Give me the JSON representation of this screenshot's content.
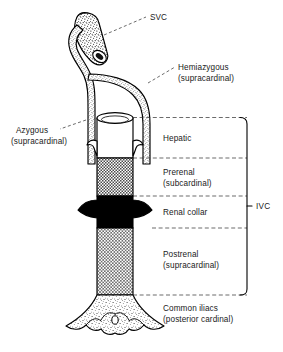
{
  "figure": {
    "labels": {
      "svc": "SVC",
      "hemiazygous_line1": "Hemiazygous",
      "hemiazygous_line2": "(supracardinal)",
      "azygous_line1": "Azygous",
      "azygous_line2": "(supracardinal)",
      "hepatic": "Hepatic",
      "prerenal_line1": "Prerenal",
      "prerenal_line2": "(subcardinal)",
      "renal_collar": "Renal collar",
      "postrenal_line1": "Postrenal",
      "postrenal_line2": "(supracardinal)",
      "common_iliacs_line1": "Common iliacs",
      "common_iliacs_line2": "(posterior cardinal)",
      "ivc": "IVC"
    },
    "segments": [
      {
        "name": "hepatic",
        "label": "Hepatic",
        "fill": "white"
      },
      {
        "name": "prerenal",
        "label": "Prerenal (subcardinal)",
        "fill": "crosshatch"
      },
      {
        "name": "renal-collar",
        "label": "Renal collar",
        "fill": "solid-black"
      },
      {
        "name": "postrenal",
        "label": "Postrenal (supracardinal)",
        "fill": "crosshatch-light"
      },
      {
        "name": "common-iliacs",
        "label": "Common iliacs (posterior cardinal)",
        "fill": "stipple"
      }
    ],
    "colors": {
      "ink": "#000000",
      "leader": "#2b2b2b",
      "background": "#ffffff"
    }
  }
}
